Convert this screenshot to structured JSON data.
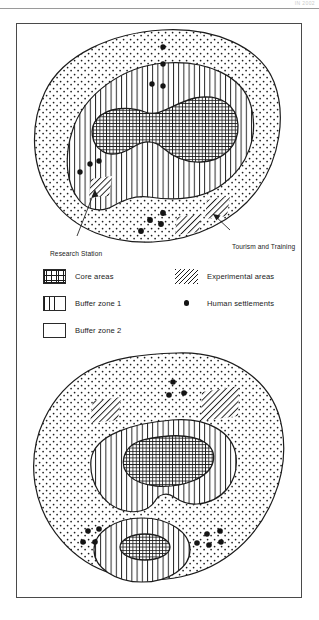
{
  "figure": {
    "corner_note": "IN 2002"
  },
  "legend": {
    "items": [
      {
        "key": "core",
        "label": "Core areas",
        "pattern": "crosshatch-grid"
      },
      {
        "key": "buffer1",
        "label": "Buffer zone 1",
        "pattern": "vertical-lines"
      },
      {
        "key": "buffer2",
        "label": "Buffer zone 2",
        "pattern": "stipple-dots"
      },
      {
        "key": "experimental",
        "label": "Experimental areas",
        "pattern": "diagonal-hatch"
      },
      {
        "key": "settlements",
        "label": "Human settlements",
        "pattern": "filled-dot"
      }
    ]
  },
  "maps": [
    {
      "id": "map-top",
      "name": "single-core-reserve-diagram",
      "annotations": [
        {
          "id": "research-station",
          "label": "Research Station"
        },
        {
          "id": "tourism-and-training",
          "label": "Tourism and Training"
        }
      ],
      "zones": {
        "core_areas": 1,
        "buffer_zone_1": 1,
        "buffer_zone_2": 1,
        "experimental_areas": 3
      },
      "settlement_count": 11
    },
    {
      "id": "map-bottom",
      "name": "dual-core-reserve-diagram",
      "annotations": [],
      "zones": {
        "core_areas": 2,
        "buffer_zone_1": 2,
        "buffer_zone_2": 1,
        "experimental_areas": 2
      },
      "settlement_count": 12
    }
  ],
  "colors": {
    "ink": "#1a1a1a",
    "frame": "#4a4a4a",
    "paper": "#ffffff",
    "settlement_dot": "#141414",
    "rule": "#9a9a9a"
  }
}
